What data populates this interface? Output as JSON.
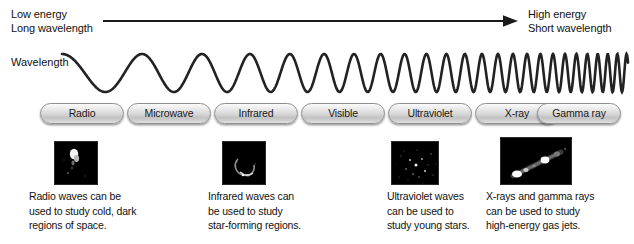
{
  "axis": {
    "low_line1": "Low energy",
    "low_line2": "Long wavelength",
    "high_line1": "High energy",
    "high_line2": "Short wavelength",
    "wavelength_label": "Wavelength",
    "arrow_direction": "left-to-right"
  },
  "bands": [
    {
      "label": "Radio",
      "left": 40,
      "width": 84
    },
    {
      "label": "Microwave",
      "left": 127,
      "width": 84
    },
    {
      "label": "Infrared",
      "left": 214,
      "width": 84
    },
    {
      "label": "Visible",
      "left": 301,
      "width": 84
    },
    {
      "label": "Ultraviolet",
      "left": 388,
      "width": 84
    },
    {
      "label": "X-ray",
      "left": 475,
      "width": 84
    },
    {
      "label": "Gamma ray",
      "left": 537,
      "width": 84
    }
  ],
  "examples": [
    {
      "image_name": "radio-galaxy-thumbnail",
      "caption_lines": [
        "Radio waves can be",
        "used to study cold, dark",
        "regions of space."
      ]
    },
    {
      "image_name": "infrared-nebula-thumbnail",
      "caption_lines": [
        "Infrared waves can",
        "be used to study",
        "star-forming regions."
      ]
    },
    {
      "image_name": "ultraviolet-starfield-thumbnail",
      "caption_lines": [
        "Ultraviolet waves",
        "can be used to",
        "study young stars."
      ]
    },
    {
      "image_name": "xray-gas-jet-thumbnail",
      "caption_lines": [
        "X-rays and gamma rays",
        "can be used to study",
        "high-energy gas jets."
      ]
    }
  ],
  "colors": {
    "text": "#111111",
    "wave": "#222222",
    "arrow": "#1a1a1a",
    "pill_border": "#8f8f8f",
    "thumb_background": "#000000"
  },
  "chart_data": {
    "type": "diagram",
    "xlabel": "Wavelength / Energy",
    "axis_left": "Low energy, Long wavelength",
    "axis_right": "High energy, Short wavelength",
    "categories": [
      "Radio",
      "Microwave",
      "Infrared",
      "Visible",
      "Ultraviolet",
      "X-ray",
      "Gamma ray"
    ],
    "wave": {
      "start_wavelength_px": 95,
      "end_wavelength_px": 9,
      "amplitude_px": 19,
      "cycles": 24,
      "progression": "exponentially decreasing wavelength"
    },
    "legend": []
  }
}
